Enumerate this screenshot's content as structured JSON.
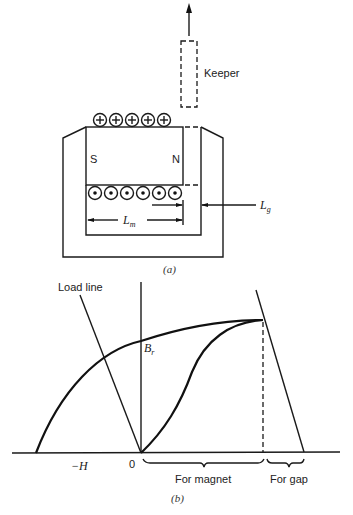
{
  "figure_a": {
    "caption": "(a)",
    "keeper_label": "Keeper",
    "pole_left": "S",
    "pole_right": "N",
    "length_magnet": "L",
    "length_magnet_sub": "m",
    "length_gap": "L",
    "length_gap_sub": "g",
    "top_conductor_symbol": "+",
    "top_conductor_count": 5,
    "bottom_conductor_symbol": "dot",
    "bottom_conductor_count": 6
  },
  "figure_b": {
    "caption": "(b)",
    "load_line_label": "Load line",
    "remanence_label": "B",
    "remanence_sub": "r",
    "neg_h_label": "−H",
    "origin_label": "0",
    "brace_magnet_label": "For magnet",
    "brace_gap_label": "For gap"
  }
}
